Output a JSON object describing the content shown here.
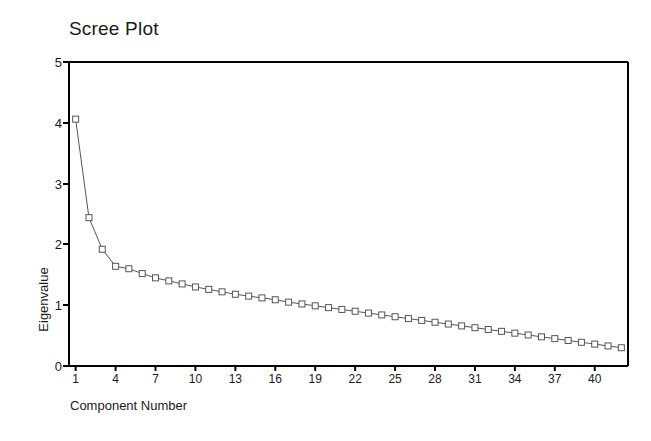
{
  "chart_data": {
    "type": "line",
    "title": "Scree Plot",
    "xlabel": "Component Number",
    "ylabel": "Eigenvalue",
    "xlim": [
      0.5,
      42.5
    ],
    "ylim": [
      0,
      5
    ],
    "grid": false,
    "legend": null,
    "marker": "open-square",
    "line_style": "solid-thin",
    "series": [
      {
        "name": "Eigenvalue",
        "x": [
          1,
          2,
          3,
          4,
          5,
          6,
          7,
          8,
          9,
          10,
          11,
          12,
          13,
          14,
          15,
          16,
          17,
          18,
          19,
          20,
          21,
          22,
          23,
          24,
          25,
          26,
          27,
          28,
          29,
          30,
          31,
          32,
          33,
          34,
          35,
          36,
          37,
          38,
          39,
          40,
          41,
          42
        ],
        "values": [
          4.06,
          2.44,
          1.92,
          1.64,
          1.6,
          1.52,
          1.45,
          1.4,
          1.35,
          1.3,
          1.26,
          1.22,
          1.18,
          1.15,
          1.12,
          1.09,
          1.05,
          1.02,
          0.99,
          0.96,
          0.93,
          0.9,
          0.87,
          0.84,
          0.81,
          0.78,
          0.75,
          0.72,
          0.69,
          0.66,
          0.63,
          0.6,
          0.57,
          0.54,
          0.51,
          0.48,
          0.45,
          0.42,
          0.39,
          0.36,
          0.33,
          0.3
        ]
      }
    ],
    "x_ticks": [
      1,
      4,
      7,
      10,
      13,
      16,
      19,
      22,
      25,
      28,
      31,
      34,
      37,
      40
    ],
    "y_ticks": [
      0,
      1,
      2,
      3,
      4,
      5
    ],
    "colors": {
      "line": "#555555",
      "marker_stroke": "#555555",
      "marker_fill": "#ffffff",
      "axis": "#000000",
      "text": "#1a1a1a",
      "background": "#ffffff"
    }
  },
  "labels": {
    "y_tick_0": "0",
    "y_tick_1": "1",
    "y_tick_2": "2",
    "y_tick_3": "3",
    "y_tick_4": "4",
    "y_tick_5": "5",
    "x_tick_1": "1",
    "x_tick_4": "4",
    "x_tick_7": "7",
    "x_tick_10": "10",
    "x_tick_13": "13",
    "x_tick_16": "16",
    "x_tick_19": "19",
    "x_tick_22": "22",
    "x_tick_25": "25",
    "x_tick_28": "28",
    "x_tick_31": "31",
    "x_tick_34": "34",
    "x_tick_37": "37",
    "x_tick_40": "40"
  }
}
